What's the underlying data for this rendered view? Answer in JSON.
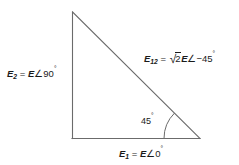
{
  "figure": {
    "type": "phasor-right-triangle-diagram",
    "background_color": "#ffffff",
    "line_color": "#6b6b6b",
    "text_color": "#1a1a1a",
    "vertices": {
      "apex_top_left": [
        72,
        12
      ],
      "right_angle_bottom_left": [
        72,
        138
      ],
      "bottom_right": [
        200,
        138
      ]
    },
    "angle_arc": {
      "at_vertex": "bottom_right",
      "radius": 36,
      "value": "45"
    }
  },
  "labels": {
    "e2": {
      "symbol": "E",
      "subscript": "2",
      "equals": "=",
      "magnitude": "E",
      "angle_sign": "∠",
      "angle_value": "90",
      "degree": "°",
      "full_text": "E2 = E∠90°"
    },
    "e12": {
      "symbol": "E",
      "subscript": "12",
      "equals": "=",
      "radical": "√",
      "radicand": "2",
      "magnitude": "E",
      "angle_sign": "∠",
      "angle_value": "−45",
      "degree": "°",
      "full_text": "E12 = √2 E∠−45°"
    },
    "e1": {
      "symbol": "E",
      "subscript": "1",
      "equals": "=",
      "magnitude": "E",
      "angle_sign": "∠",
      "angle_value": "0",
      "degree": "°",
      "full_text": "E1 = E∠0°"
    },
    "angle": {
      "value": "45",
      "degree": "°",
      "full_text": "45°"
    }
  }
}
